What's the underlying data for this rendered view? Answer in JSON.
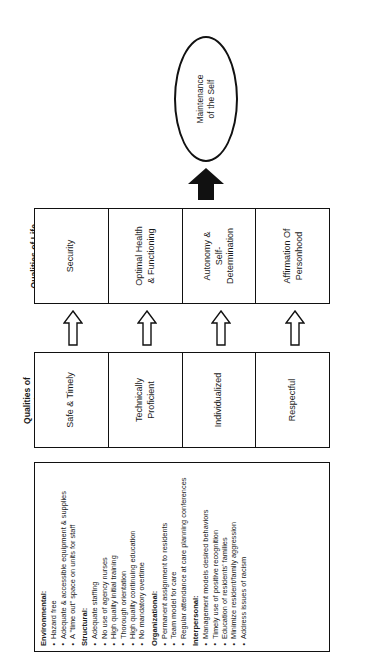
{
  "diagram": {
    "title_ellipse": {
      "line1": "Maintenance",
      "line2": "of the Self"
    },
    "arrow_big": "solid-up-arrow",
    "bands": {
      "qualities_of_life": {
        "label_line1": "Qualities of Life",
        "cells": [
          {
            "line1": "Security",
            "line2": ""
          },
          {
            "line1": "Optimal Health",
            "line2": "& Functioning"
          },
          {
            "line1": "Autonomy &",
            "line2": "Self-",
            "line3": "Determination"
          },
          {
            "line1": "Affirmation Of",
            "line2": "Personhood"
          }
        ]
      },
      "qualities_of_caring": {
        "label_line1": "Qualities of",
        "label_line2": "Caring",
        "cells": [
          {
            "line1": "Safe & Timely",
            "line2": ""
          },
          {
            "line1": "Technically",
            "line2": "Proficient"
          },
          {
            "line1": "Individualized",
            "line2": ""
          },
          {
            "line1": "Respectful",
            "line2": ""
          }
        ]
      },
      "care_provider_requirements": {
        "label": "Care Provider Requirements",
        "groups": [
          {
            "heading": "Environmental:",
            "items": [
              "Hazard free",
              "Adequate & accessible equipment & supplies",
              "A \"time out\" space on units for staff"
            ]
          },
          {
            "heading": "Structural:",
            "items": [
              "Adequate staffing",
              "No use of agency nurses",
              "High quality initial training",
              "Thorough orientation",
              "High quality continuing education",
              "No mandatory overtime"
            ]
          },
          {
            "heading": "Organizational:",
            "items": [
              "Permanent assignment to residents",
              "Team model for care",
              "Regular attendance at care planning conferences"
            ]
          },
          {
            "heading": "Interpersonal:",
            "items": [
              "Management models desired behaviors",
              "Timely use of positive recognition",
              "Education of residents' families",
              "Minimize resident/family aggression",
              "Address issues of racism"
            ]
          }
        ]
      }
    },
    "hollow_arrows_count": 4,
    "colors": {
      "stroke": "#111111",
      "background": "#ffffff",
      "text": "#1a1a1a"
    }
  }
}
